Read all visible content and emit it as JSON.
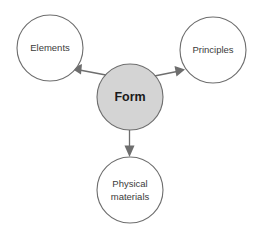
{
  "diagram": {
    "background_color": "#ffffff",
    "center_node": {
      "id": "form",
      "label": "Form",
      "fill_color": "#d4d4d4",
      "stroke_color": "#6e6e6e",
      "cx": 130,
      "cy": 97,
      "r": 33
    },
    "nodes": [
      {
        "id": "elements",
        "label": "Elements",
        "fill_color": "#ffffff",
        "stroke_color": "#6e6e6e",
        "cx": 50,
        "cy": 48,
        "r": 33,
        "lines": [
          "Elements"
        ]
      },
      {
        "id": "principles",
        "label": "Principles",
        "fill_color": "#ffffff",
        "stroke_color": "#6e6e6e",
        "cx": 213,
        "cy": 50,
        "r": 33,
        "lines": [
          "Principles"
        ]
      },
      {
        "id": "physical-materials",
        "label": "Physical materials",
        "fill_color": "#ffffff",
        "stroke_color": "#6e6e6e",
        "cx": 130,
        "cy": 190,
        "r": 33,
        "lines": [
          "Physical",
          "materials"
        ]
      }
    ],
    "arrows": [
      {
        "id": "form-to-elements",
        "from": "form",
        "to": "elements",
        "color": "#6e6e6e"
      },
      {
        "id": "form-to-principles",
        "from": "form",
        "to": "principles",
        "color": "#6e6e6e"
      },
      {
        "id": "form-to-physical-materials",
        "from": "form",
        "to": "physical-materials",
        "color": "#6e6e6e"
      }
    ]
  }
}
